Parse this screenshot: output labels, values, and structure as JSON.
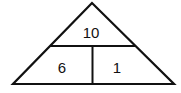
{
  "diagram": {
    "type": "number-bond-triangle",
    "top": "10",
    "bottom_left": "6",
    "bottom_right": "1",
    "stroke_color": "#111111"
  }
}
